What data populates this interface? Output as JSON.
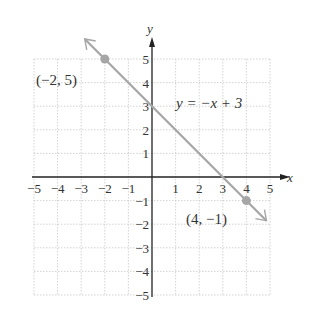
{
  "chart_data": {
    "type": "line",
    "title": "",
    "xlabel": "x",
    "ylabel": "y",
    "xlim": [
      -5,
      5
    ],
    "ylim": [
      -5,
      5
    ],
    "grid": true,
    "x_ticks": [
      "−5",
      "−4",
      "−3",
      "−2",
      "−1",
      "1",
      "2",
      "3",
      "4",
      "5"
    ],
    "y_ticks": [
      "5",
      "4",
      "3",
      "2",
      "1",
      "−1",
      "−2",
      "−3",
      "−4",
      "−5"
    ],
    "series": [
      {
        "name": "y = −x + 3",
        "x": [
          -2,
          4
        ],
        "y": [
          5,
          -1
        ],
        "slope": -1,
        "intercept": 3
      }
    ],
    "points": [
      {
        "x": -2,
        "y": 5,
        "label": "(−2, 5)"
      },
      {
        "x": 4,
        "y": -1,
        "label": "(4, −1)"
      }
    ],
    "equation_label": "y = −x + 3",
    "line_color": "#a6a6a6",
    "point_color": "#a6a6a6"
  }
}
